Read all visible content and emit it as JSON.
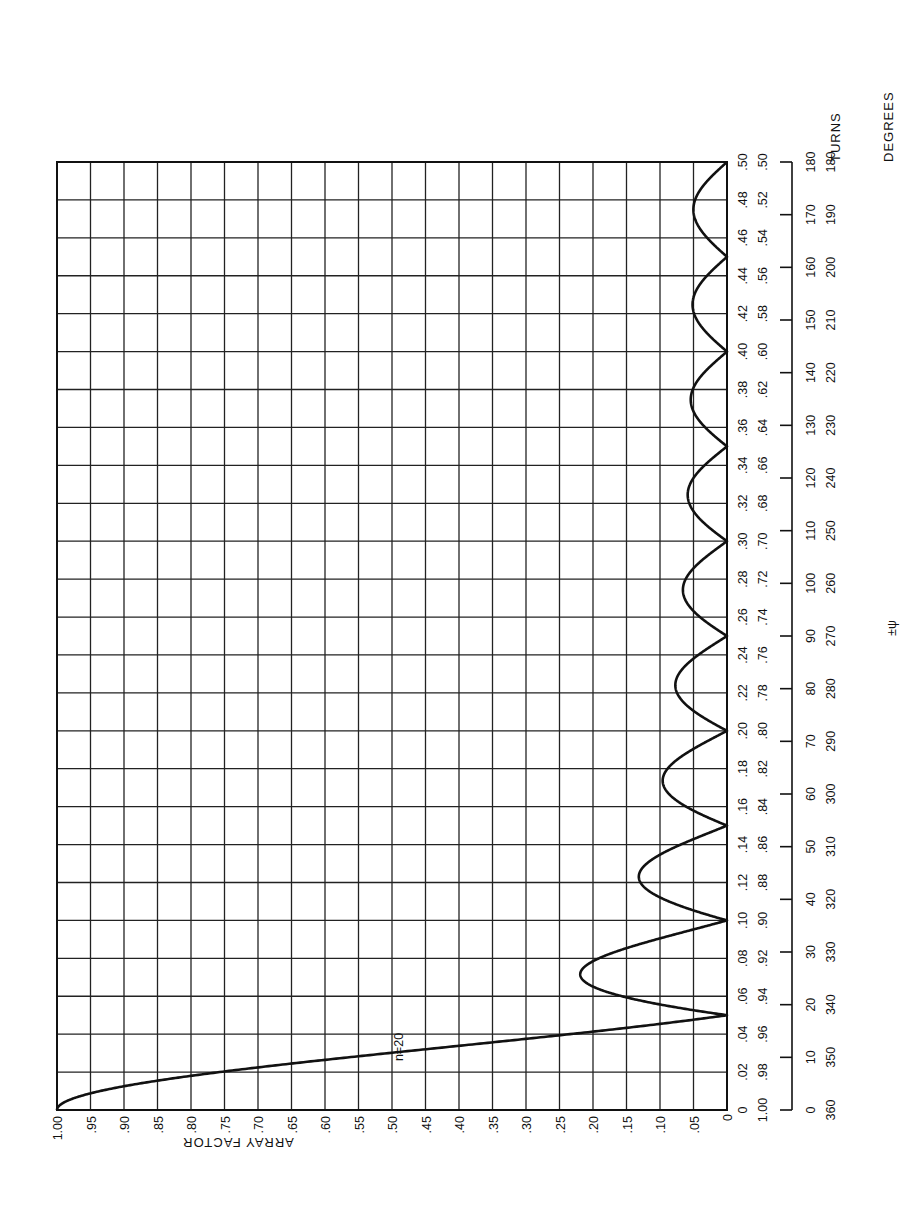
{
  "chart_data": {
    "type": "line",
    "orientation": "rotated 90 degrees (array factor increases to the left, psi increases upward)",
    "title": "",
    "xlabel": "ARRAY FACTOR",
    "ylabel_turns": "TURNS",
    "ylabel_degrees": "DEGREES",
    "ylabel_psi": "±ψ",
    "xlim": [
      0,
      1.0
    ],
    "ylim_turns": [
      0,
      0.5
    ],
    "grid": true,
    "legend": [],
    "annotations": [
      "n=20"
    ],
    "array_factor_ticks": [
      "1.00",
      ".95",
      ".90",
      ".85",
      ".80",
      ".75",
      ".70",
      ".65",
      ".60",
      ".55",
      ".50",
      ".45",
      ".40",
      ".35",
      ".30",
      ".25",
      ".20",
      ".15",
      ".10",
      ".05",
      "0"
    ],
    "turns_ticks_inner": [
      "0",
      ".02",
      ".04",
      ".06",
      ".08",
      ".10",
      ".12",
      ".14",
      ".16",
      ".18",
      ".20",
      ".22",
      ".24",
      ".26",
      ".28",
      ".30",
      ".32",
      ".34",
      ".36",
      ".38",
      ".40",
      ".42",
      ".44",
      ".46",
      ".48",
      ".50"
    ],
    "turns_ticks_outer": [
      "1.00",
      ".98",
      ".96",
      ".94",
      ".92",
      ".90",
      ".88",
      ".86",
      ".84",
      ".82",
      ".80",
      ".78",
      ".76",
      ".74",
      ".72",
      ".70",
      ".68",
      ".66",
      ".64",
      ".62",
      ".60",
      ".58",
      ".56",
      ".54",
      ".52",
      ".50"
    ],
    "degrees_ticks_inner": [
      "0",
      "10",
      "20",
      "30",
      "40",
      "50",
      "60",
      "70",
      "80",
      "90",
      "100",
      "110",
      "120",
      "130",
      "140",
      "150",
      "160",
      "170",
      "180"
    ],
    "degrees_ticks_outer": [
      "360",
      "350",
      "340",
      "330",
      "320",
      "310",
      "300",
      "290",
      "280",
      "270",
      "260",
      "250",
      "240",
      "230",
      "220",
      "210",
      "200",
      "190",
      "180"
    ],
    "series": [
      {
        "name": "n=20",
        "formula": "|sin(n*psi/2) / (n*sin(psi/2))|",
        "n": 20,
        "x_psi_turns": [
          0.0,
          0.01,
          0.02,
          0.03,
          0.04,
          0.05,
          0.06,
          0.075,
          0.09,
          0.1,
          0.125,
          0.15,
          0.175,
          0.2,
          0.225,
          0.25,
          0.275,
          0.3,
          0.325,
          0.35,
          0.375,
          0.4,
          0.425,
          0.45,
          0.475,
          0.5
        ],
        "array_factor": [
          1.0,
          0.935,
          0.757,
          0.504,
          0.234,
          0.0,
          0.156,
          0.217,
          0.107,
          0.0,
          0.128,
          0.0,
          0.083,
          0.0,
          0.066,
          0.0,
          0.058,
          0.0,
          0.054,
          0.0,
          0.052,
          0.0,
          0.051,
          0.0,
          0.05,
          0.0
        ]
      }
    ],
    "nulls_turns": [
      0.05,
      0.1,
      0.15,
      0.2,
      0.25,
      0.3,
      0.35,
      0.4,
      0.45,
      0.5
    ],
    "sidelobe_peaks": [
      {
        "turns": 0.0715,
        "value": 0.217
      },
      {
        "turns": 0.1229,
        "value": 0.128
      },
      {
        "turns": 0.1737,
        "value": 0.091
      },
      {
        "turns": 0.2242,
        "value": 0.071
      },
      {
        "turns": 0.2745,
        "value": 0.059
      },
      {
        "turns": 0.3247,
        "value": 0.054
      },
      {
        "turns": 0.3748,
        "value": 0.051
      },
      {
        "turns": 0.4249,
        "value": 0.05
      },
      {
        "turns": 0.4749,
        "value": 0.05
      }
    ]
  }
}
